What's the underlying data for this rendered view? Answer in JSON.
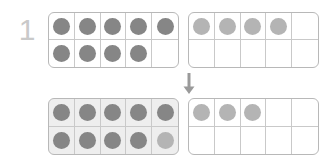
{
  "problem": {
    "number": "1",
    "type": "ten-frame-regrouping",
    "arrow_icon": "arrow-down-icon"
  },
  "colors": {
    "dot_dark": "#868686",
    "dot_light": "#b4b4b4",
    "frame_border": "#b8b8b8",
    "cell_border": "#c9c9c9",
    "frame_shaded_bg": "#eeeeee",
    "number_label": "#c9c9c9",
    "page_bg": "#ffffff"
  },
  "frames": {
    "top_left": {
      "label": "top-left-ten-frame",
      "filled_count": 9,
      "shaded": false,
      "cells": [
        "dark",
        "dark",
        "dark",
        "dark",
        "dark",
        "dark",
        "dark",
        "dark",
        "dark",
        "none"
      ]
    },
    "top_right": {
      "label": "top-right-ten-frame",
      "filled_count": 4,
      "shaded": false,
      "cells": [
        "light",
        "light",
        "light",
        "light",
        "none",
        "none",
        "none",
        "none",
        "none",
        "none"
      ]
    },
    "bottom_left": {
      "label": "bottom-left-ten-frame",
      "filled_count": 10,
      "shaded": true,
      "cells": [
        "dark",
        "dark",
        "dark",
        "dark",
        "dark",
        "dark",
        "dark",
        "dark",
        "dark",
        "light"
      ]
    },
    "bottom_right": {
      "label": "bottom-right-ten-frame",
      "filled_count": 3,
      "shaded": false,
      "cells": [
        "light",
        "light",
        "light",
        "none",
        "none",
        "none",
        "none",
        "none",
        "none",
        "none"
      ]
    }
  }
}
